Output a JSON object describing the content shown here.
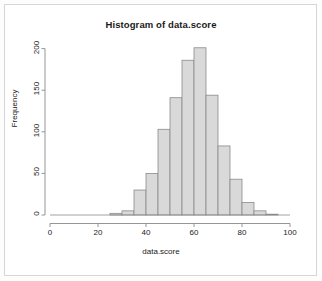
{
  "chart_data": {
    "type": "bar",
    "title": "Histogram of data.score",
    "xlabel": "data.score",
    "ylabel": "Frequency",
    "xlim": [
      0,
      100
    ],
    "ylim": [
      0,
      210
    ],
    "grid": false,
    "legend": null,
    "bin_width": 5,
    "bin_starts": [
      25,
      30,
      35,
      40,
      45,
      50,
      55,
      60,
      65,
      70,
      75,
      80,
      85,
      90
    ],
    "categories": [
      "25-30",
      "30-35",
      "35-40",
      "40-45",
      "45-50",
      "50-55",
      "55-60",
      "60-65",
      "65-70",
      "70-75",
      "75-80",
      "80-85",
      "85-90",
      "90-95"
    ],
    "values": [
      2,
      5,
      30,
      50,
      103,
      141,
      186,
      201,
      144,
      83,
      43,
      15,
      5,
      1
    ],
    "x_ticks": [
      0,
      20,
      40,
      60,
      80,
      100
    ],
    "x_tick_labels": [
      "0",
      "20",
      "40",
      "60",
      "80",
      "100"
    ],
    "y_ticks": [
      0,
      50,
      100,
      150,
      200
    ],
    "y_tick_labels": [
      "0",
      "50",
      "100",
      "150",
      "200"
    ],
    "bar_fill": "#d9d9d9",
    "bar_stroke": "#8a8a8a",
    "axis_color": "#8a8a8a"
  },
  "figure": {
    "background": "#ffffff",
    "frame_color": "#d6d6d6"
  }
}
